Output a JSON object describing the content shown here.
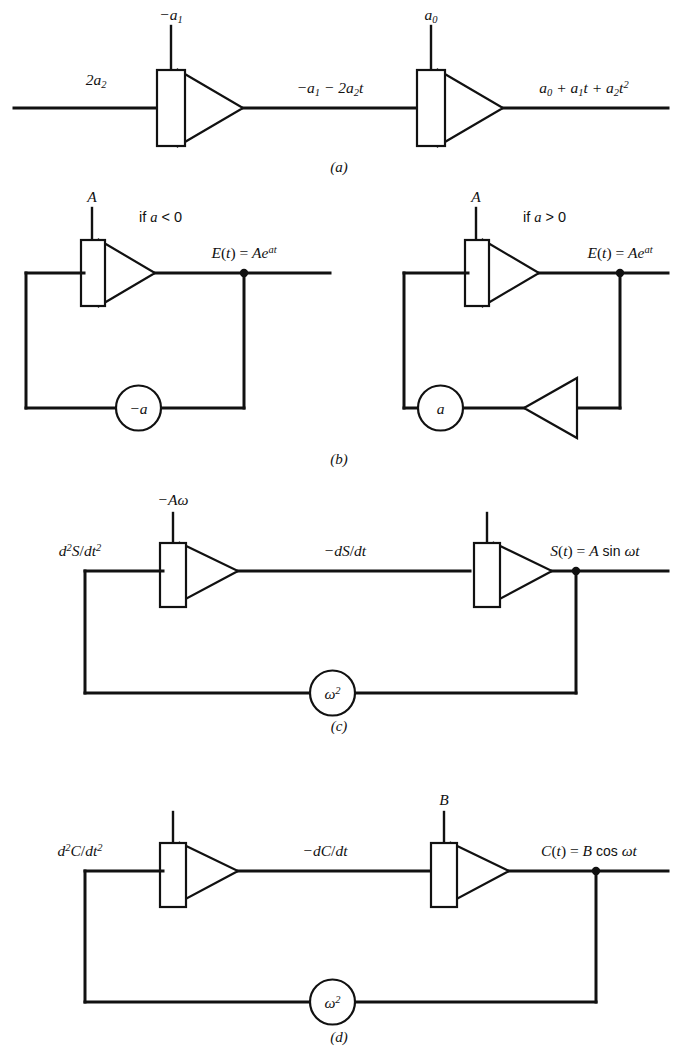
{
  "figure": {
    "background_color": "#ffffff",
    "line_color": "#111111",
    "panels": [
      {
        "id": "a",
        "label": "(a)",
        "description": "Two cascaded integrators generating a quadratic polynomial",
        "input_label": "2a₂",
        "first_integrator_initial_condition": "−a₁",
        "intermediate_label": "−a₁ − 2a₂t",
        "second_integrator_initial_condition": "a₀",
        "output_label": "a₀ + a₁t + a₂t²"
      },
      {
        "id": "b",
        "label": "(b)",
        "description": "Exponential generator circuits with feedback through a coefficient potentiometer",
        "left": {
          "condition": "if a < 0",
          "initial_condition": "A",
          "output_label": "E(t) = Ae^{at}",
          "feedback_coefficient": "−a"
        },
        "right": {
          "condition": "if a > 0",
          "initial_condition": "A",
          "output_label": "E(t) = Ae^{at}",
          "feedback_coefficient": "a",
          "has_inverter": true
        }
      },
      {
        "id": "c",
        "label": "(c)",
        "description": "Sine generator: two integrators with omega-squared feedback",
        "input_label": "d²S/dt²",
        "first_integrator_initial_condition": "−Aω",
        "intermediate_label": "−dS/dt",
        "second_integrator_initial_condition": "",
        "output_label": "S(t) = A sin ωt",
        "feedback_coefficient": "ω²"
      },
      {
        "id": "d",
        "label": "(d)",
        "description": "Cosine generator: two integrators with omega-squared feedback",
        "input_label": "d²C/dt²",
        "first_integrator_initial_condition": "",
        "intermediate_label": "−dC/dt",
        "second_integrator_initial_condition": "B",
        "output_label": "C(t) = B cos ωt",
        "feedback_coefficient": "ω²"
      }
    ]
  }
}
